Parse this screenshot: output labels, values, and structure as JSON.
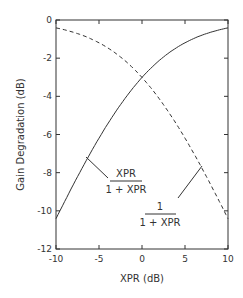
{
  "chart_data": {
    "type": "line",
    "title": "",
    "xlabel": "XPR  (dB)",
    "ylabel": "Gain Degradation  (dB)",
    "xlim": [
      -10,
      10
    ],
    "ylim": [
      -12,
      0
    ],
    "xticks": [
      "-10",
      "-5",
      "0",
      "5",
      "10"
    ],
    "yticks": [
      "0",
      "-2",
      "-4",
      "-6",
      "-8",
      "-10",
      "-12"
    ],
    "grid": false,
    "series": [
      {
        "name": "XPR/(1+XPR)",
        "style": "solid",
        "x": [
          -10,
          -8,
          -6,
          -4,
          -2,
          0,
          2,
          4,
          6,
          8,
          10
        ],
        "values": [
          -10.41,
          -8.64,
          -6.97,
          -5.46,
          -4.12,
          -3.01,
          -2.12,
          -1.46,
          -0.97,
          -0.64,
          -0.41
        ]
      },
      {
        "name": "1/(1+XPR)",
        "style": "dashed",
        "x": [
          -10,
          -8,
          -6,
          -4,
          -2,
          0,
          2,
          4,
          6,
          8,
          10
        ],
        "values": [
          -0.41,
          -0.64,
          -0.97,
          -1.46,
          -2.12,
          -3.01,
          -4.12,
          -5.46,
          -6.97,
          -8.64,
          -10.41
        ]
      }
    ],
    "annotations": [
      {
        "text_num": "XPR",
        "text_den": "1 + XPR",
        "points_to": "solid"
      },
      {
        "text_num": "1",
        "text_den": "1 + XPR",
        "points_to": "dashed"
      }
    ]
  }
}
